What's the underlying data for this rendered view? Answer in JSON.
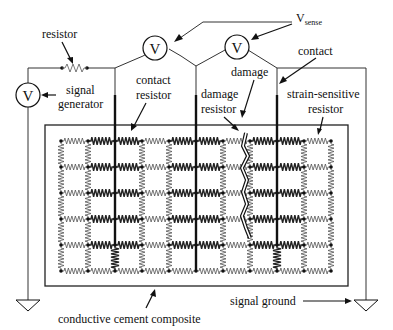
{
  "figure": {
    "labels": {
      "resistor": "resistor",
      "signal_line1": "signal",
      "signal_line2": "generator",
      "vsense_main": "V",
      "vsense_sub": "sense",
      "contact": "contact",
      "contact_resistor_line1": "contact",
      "contact_resistor_line2": "resistor",
      "damage": "damage",
      "damage_resistor_line1": "damage",
      "damage_resistor_line2": "resistor",
      "strain_line1": "strain-sensitive",
      "strain_line2": "resistor",
      "composite": "conductive cement composite",
      "ground": "signal ground"
    },
    "voltmeter_symbol": "V",
    "grid": {
      "columns": 11,
      "rows": 6,
      "electrode_columns": [
        2,
        5,
        8
      ],
      "heavy_vertical_bottom_columns": [
        2,
        8
      ],
      "damage_column_gap": [
        5,
        6
      ]
    }
  }
}
